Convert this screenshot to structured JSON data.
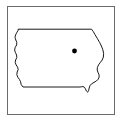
{
  "figure": {
    "type": "locator-map",
    "width": 122,
    "height": 122,
    "background_color": "#ffffff"
  },
  "frame": {
    "label": "map border",
    "color": "#6b6b6b",
    "line_width": 1,
    "x": 7,
    "y": 6,
    "width": 108,
    "height": 109
  },
  "state": {
    "name": "Iowa",
    "outline_color": "#000000",
    "fill_color": "#ffffff",
    "line_width": 0.9,
    "borders": {
      "north": "straight",
      "south": "straight",
      "west": "river-jagged",
      "east": "river-jagged"
    },
    "path": "M 18.5 29.2 L 91.5 29.2 L 93.2 31.4 L 95.0 34.6 L 97.4 38.6 L 99.6 42.4 L 101.4 46.0 L 102.8 49.6 L 103.6 53.4 L 103.4 57.0 L 102.2 60.0 L 100.4 62.4 L 98.6 64.8 L 97.4 67.4 L 97.2 70.0 L 98.0 72.4 L 99.0 74.6 L 99.2 77.0 L 98.2 79.2 L 96.4 81.0 L 94.0 82.4 L 91.6 83.8 L 90.0 85.6 L 89.2 88.0 L 88.6 90.6 L 87.6 92.2 L 86.4 91.0 L 85.4 88.8 L 84.4 87.2 L 83.0 86.6 L 81.4 86.8 L 80.0 87.0 L 23.0 87.0 L 21.2 84.6 L 20.6 81.8 L 19.4 79.4 L 17.8 77.2 L 16.8 74.6 L 17.2 72.0 L 18.2 69.6 L 17.6 67.2 L 16.2 65.0 L 15.2 62.6 L 15.6 60.0 L 16.8 57.6 L 16.6 55.0 L 15.4 52.6 L 14.6 50.0 L 15.2 47.4 L 16.6 45.0 L 16.8 42.4 L 15.8 40.0 L 15.0 37.4 L 15.6 34.8 L 17.0 32.2 L 18.0 30.6 Z"
  },
  "marker": {
    "type": "point",
    "shape": "filled-circle",
    "color": "#000000",
    "x": 74.5,
    "y": 51.0,
    "radius": 2.4,
    "label": "location marker"
  }
}
